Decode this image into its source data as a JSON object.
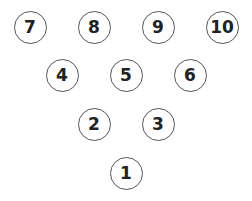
{
  "diagram": {
    "type": "bowling-pin-layout",
    "pins": [
      {
        "label": "7",
        "cx": 30,
        "cy": 27
      },
      {
        "label": "8",
        "cx": 94,
        "cy": 27
      },
      {
        "label": "9",
        "cx": 158,
        "cy": 27
      },
      {
        "label": "10",
        "cx": 222,
        "cy": 27
      },
      {
        "label": "4",
        "cx": 62,
        "cy": 75
      },
      {
        "label": "5",
        "cx": 126,
        "cy": 75
      },
      {
        "label": "6",
        "cx": 190,
        "cy": 75
      },
      {
        "label": "2",
        "cx": 94,
        "cy": 124
      },
      {
        "label": "3",
        "cx": 158,
        "cy": 124
      },
      {
        "label": "1",
        "cx": 126,
        "cy": 173
      }
    ],
    "colors": {
      "stroke": "#555555",
      "text": "#222222",
      "background": "#ffffff"
    }
  }
}
